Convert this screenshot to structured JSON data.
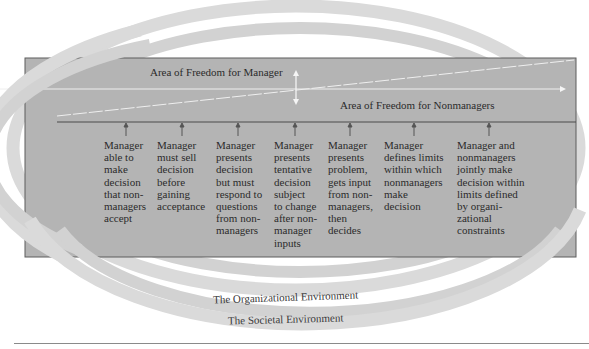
{
  "diagram": {
    "colors": {
      "box_fill": "#b3b3b3",
      "box_fill_lower": "#b6b6b6",
      "box_border": "#5a5a5a",
      "ring_outer": "#d9d9d9",
      "ring_inner": "#cfcfcf",
      "divider_line": "#f2f2f2"
    },
    "manager_area_label": "Area of Freedom for Manager",
    "nonmanager_area_label": "Area of Freedom for Nonmanagers",
    "behaviors": [
      {
        "text": "Manager\nable to\nmake\ndecision\nthat non-\nmanagers\naccept"
      },
      {
        "text": "Manager\nmust sell\ndecision\nbefore\ngaining\nacceptance"
      },
      {
        "text": "Manager\npresents\ndecision\nbut must\nrespond to\nquestions\nfrom non-\nmanagers"
      },
      {
        "text": "Manager\npresents\ntentative\ndecision\nsubject\nto change\nafter non-\nmanager\ninputs"
      },
      {
        "text": "Manager\npresents\nproblem,\ngets input\nfrom non-\nmanagers,\nthen\ndecides"
      },
      {
        "text": "Manager\ndefines limits\nwithin which\nnonmanagers\nmake\ndecision"
      },
      {
        "text": "Manager and\nnonmanagers\njointly make\ndecision within\nlimits defined\nby organi-\nzational\nconstraints"
      }
    ],
    "environments": {
      "organizational": "The Organizational Environment",
      "societal": "The Societal Environment"
    }
  }
}
